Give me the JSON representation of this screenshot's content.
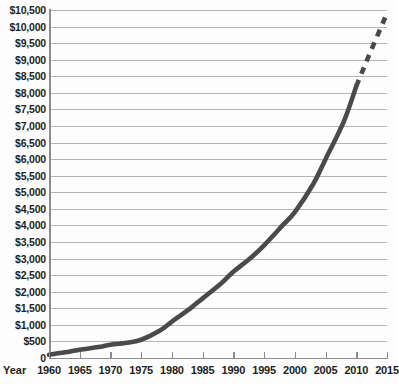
{
  "chart_data": {
    "type": "line",
    "title": "",
    "subtitle": "",
    "xlabel": "Year",
    "ylabel": "",
    "grid": true,
    "legend_position": "none",
    "xlim": [
      1960,
      2015
    ],
    "ylim": [
      0,
      10500
    ],
    "y_tick_step": 500,
    "x_tick_step": 5,
    "x_tick_labels": [
      "1960",
      "1965",
      "1970",
      "1975",
      "1980",
      "1985",
      "1990",
      "1995",
      "2000",
      "2005",
      "2010",
      "2015"
    ],
    "y_tick_labels": [
      "$10,500",
      "$10,000",
      "$9,500",
      "$9,000",
      "$8,500",
      "$8,000",
      "$7,500",
      "$7,000",
      "$6,500",
      "$6,000",
      "$5,500",
      "$5,000",
      "$4,500",
      "$4,000",
      "$3,500",
      "$3,000",
      "$2,500",
      "$2,000",
      "$1,500",
      "$1,000",
      "$500",
      "0"
    ],
    "y_tick_values": [
      10500,
      10000,
      9500,
      9000,
      8500,
      8000,
      7500,
      7000,
      6500,
      6000,
      5500,
      5000,
      4500,
      4000,
      3500,
      3000,
      2500,
      2000,
      1500,
      1000,
      500,
      0
    ],
    "series": [
      {
        "name": "Actual",
        "style": "solid",
        "color": "#4a4a4a",
        "x": [
          1960,
          1963,
          1965,
          1968,
          1970,
          1973,
          1975,
          1978,
          1980,
          1983,
          1985,
          1988,
          1990,
          1993,
          1995,
          1998,
          2000,
          2003,
          2005,
          2008,
          2010
        ],
        "values": [
          100,
          180,
          250,
          330,
          400,
          470,
          550,
          820,
          1100,
          1500,
          1800,
          2250,
          2600,
          3050,
          3400,
          4000,
          4400,
          5250,
          6000,
          7150,
          8200
        ]
      },
      {
        "name": "Projected",
        "style": "dashed",
        "color": "#4a4a4a",
        "x": [
          2010,
          2012,
          2015
        ],
        "values": [
          8200,
          9100,
          10400
        ]
      }
    ],
    "annotations": []
  },
  "colors": {
    "line": "#4a4a4a",
    "gridline": "#b5b5b5",
    "axis": "#8d8d8d",
    "text": "#231f20",
    "background": "#fdfdfd"
  }
}
